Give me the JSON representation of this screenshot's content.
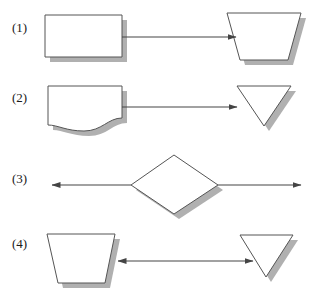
{
  "page": {
    "width": 319,
    "height": 305,
    "background": "#ffffff",
    "kind": "flowchart-shape-exercise"
  },
  "style": {
    "outline_color": "#555555",
    "shadow_color": "#b0b0b0",
    "fill_color": "#ffffff",
    "line_color": "#444444",
    "label_color": "#1a1a1a",
    "shadow_offset_x": 5,
    "shadow_offset_y": 5
  },
  "rows": [
    {
      "label": "(1)",
      "label_x": 12,
      "label_y": 32,
      "left_shape": {
        "name": "rectangle",
        "points": "45,15 122,15 122,57 45,57"
      },
      "right_shape": {
        "name": "trapezoid-down",
        "points": "227,13 301,13 288,60 240,60"
      },
      "connector": {
        "name": "arrow-right",
        "x1": 122,
        "x2": 236,
        "y": 37,
        "head_start": false,
        "head_end": true
      }
    },
    {
      "label": "(2)",
      "label_x": 12,
      "label_y": 102,
      "left_shape": {
        "name": "document-wavy-bottom",
        "path": "M48,86 L122,86 L122,118 C108,118 102,131 84,131 C66,131 58,125 48,125 Z"
      },
      "right_shape": {
        "name": "triangle-down",
        "points": "237,86 291,86 264,126"
      },
      "connector": {
        "name": "arrow-right",
        "x1": 122,
        "x2": 237,
        "y": 107,
        "head_start": false,
        "head_end": true
      }
    },
    {
      "label": "(3)",
      "label_x": 12,
      "label_y": 183,
      "center_shape": {
        "name": "diamond",
        "points": "131,185 174,155 218,185 174,214"
      },
      "connector_left": {
        "name": "arrow-left",
        "x1": 131,
        "x2": 52,
        "y": 185,
        "head_start": false,
        "head_end": true
      },
      "connector_right": {
        "name": "arrow-right",
        "x1": 218,
        "x2": 301,
        "y": 185,
        "head_start": false,
        "head_end": true
      }
    },
    {
      "label": "(4)",
      "label_x": 12,
      "label_y": 248,
      "left_shape": {
        "name": "trapezoid-down",
        "points": "47,234 115,234 105,283 58,283"
      },
      "right_shape": {
        "name": "triangle-down",
        "points": "240,235 293,235 266,277"
      },
      "connector": {
        "name": "double-arrow",
        "x1": 118,
        "x2": 253,
        "y": 261,
        "head_start": true,
        "head_end": true
      }
    }
  ]
}
